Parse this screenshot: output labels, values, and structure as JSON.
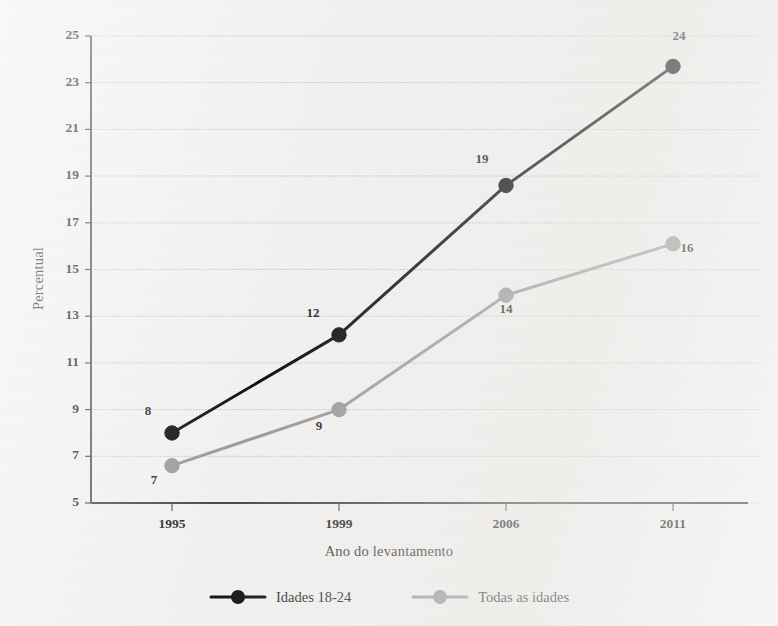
{
  "chart_data": {
    "type": "line",
    "title": "",
    "xlabel": "Ano do levantamento",
    "ylabel": "Percentual",
    "categories": [
      "1995",
      "1999",
      "2006",
      "2011"
    ],
    "x_tick_labels": [
      "1995",
      "1999",
      "2006",
      "2011"
    ],
    "y_tick_labels": [
      "5",
      "7",
      "9",
      "11",
      "13",
      "15",
      "17",
      "19",
      "21",
      "23",
      "25"
    ],
    "y_ticks": [
      5,
      7,
      9,
      11,
      13,
      15,
      17,
      19,
      21,
      23,
      25
    ],
    "ylim": [
      5,
      25
    ],
    "grid": true,
    "legend_position": "bottom",
    "series": [
      {
        "name": "Idades 18-24",
        "color": "#111111",
        "marker": "circle",
        "values": [
          8.0,
          12.2,
          18.6,
          23.7
        ],
        "data_labels": [
          "8",
          "12",
          "19",
          "24"
        ]
      },
      {
        "name": "Todas as idades",
        "color": "#9a9a9a",
        "marker": "circle",
        "values": [
          6.6,
          9.0,
          13.9,
          16.1
        ],
        "data_labels": [
          "7",
          "9",
          "14",
          "16"
        ]
      }
    ]
  },
  "legend": {
    "entries": [
      {
        "label": "Idades 18-24",
        "color": "#111111"
      },
      {
        "label": "Todas as idades",
        "color": "#9a9a9a"
      }
    ]
  },
  "axes": {
    "y_title": "Percentual",
    "x_title": "Ano do levantamento"
  },
  "colors": {
    "background": "#f2f1ef",
    "axis": "#4a4a4a",
    "grid": "#b9b9b9",
    "series_primary": "#111111",
    "series_secondary": "#9a9a9a"
  }
}
